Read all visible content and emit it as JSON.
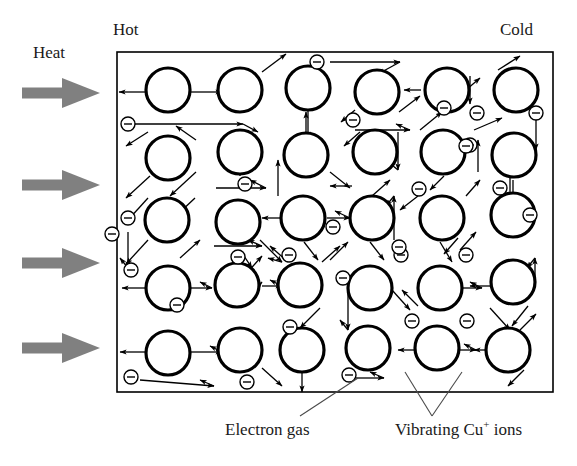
{
  "figure": {
    "type": "physics-diagram",
    "background_color": "#ffffff",
    "ink_color": "#000000",
    "heat_arrow_color": "#808080",
    "box": {
      "x": 117,
      "y": 52,
      "width": 436,
      "height": 340,
      "stroke_width": 1.6
    }
  },
  "labels": {
    "hot": "Hot",
    "cold": "Cold",
    "heat": "Heat",
    "electron_gas": "Electron gas",
    "cu_ions_prefix": "Vibrating Cu",
    "cu_ions_sup": "+",
    "cu_ions_suffix": " ions"
  },
  "heat_arrows": {
    "count": 4,
    "direction": "right",
    "color": "#808080",
    "items": [
      {
        "y": 93
      },
      {
        "y": 185
      },
      {
        "y": 263
      },
      {
        "y": 348
      }
    ],
    "shaft_x": 22,
    "shaft_width": 40,
    "shaft_height": 11,
    "head_width": 38,
    "head_height": 30
  },
  "ions": {
    "label": "Cu+ ion",
    "radius": 22,
    "stroke_width": 3.2,
    "fill": "#ffffff",
    "positions": [
      [
        168,
        90
      ],
      [
        240,
        90
      ],
      [
        308,
        88
      ],
      [
        377,
        92
      ],
      [
        447,
        90
      ],
      [
        516,
        90
      ],
      [
        168,
        158
      ],
      [
        240,
        152
      ],
      [
        306,
        155
      ],
      [
        375,
        152
      ],
      [
        443,
        152
      ],
      [
        514,
        155
      ],
      [
        167,
        220
      ],
      [
        238,
        222
      ],
      [
        303,
        218
      ],
      [
        372,
        218
      ],
      [
        442,
        218
      ],
      [
        513,
        215
      ],
      [
        168,
        288
      ],
      [
        237,
        285
      ],
      [
        300,
        285
      ],
      [
        370,
        288
      ],
      [
        440,
        288
      ],
      [
        513,
        282
      ],
      [
        168,
        353
      ],
      [
        240,
        350
      ],
      [
        302,
        350
      ],
      [
        368,
        348
      ],
      [
        437,
        348
      ],
      [
        508,
        350
      ]
    ]
  },
  "electrons": {
    "label": "electron",
    "symbol": "minus",
    "radius": 7,
    "stroke_width": 1.4,
    "positions": [
      [
        128,
        124
      ],
      [
        317,
        62
      ],
      [
        444,
        108
      ],
      [
        470,
        145
      ],
      [
        238,
        257
      ],
      [
        128,
        218
      ],
      [
        131,
        270
      ],
      [
        112,
        234
      ],
      [
        245,
        184
      ],
      [
        177,
        305
      ],
      [
        333,
        227
      ],
      [
        343,
        278
      ],
      [
        353,
        120
      ],
      [
        401,
        255
      ],
      [
        419,
        189
      ],
      [
        399,
        247
      ],
      [
        412,
        321
      ],
      [
        466,
        146
      ],
      [
        500,
        188
      ],
      [
        530,
        215
      ],
      [
        536,
        113
      ],
      [
        467,
        321
      ],
      [
        477,
        113
      ],
      [
        247,
        382
      ],
      [
        131,
        377
      ],
      [
        349,
        375
      ],
      [
        290,
        327
      ],
      [
        289,
        255
      ],
      [
        466,
        255
      ]
    ]
  },
  "motion_arrows": {
    "label": "velocity / vibration arrows",
    "stroke_width": 1.3,
    "head_size": 5
  },
  "leader_lines": {
    "electron_gas": {
      "from": [
        300,
        416
      ],
      "to": [
        358,
        378
      ]
    },
    "cu_ions_left": {
      "from": [
        432,
        416
      ],
      "to": [
        405,
        372
      ]
    },
    "cu_ions_right": {
      "from": [
        432,
        416
      ],
      "to": [
        462,
        372
      ]
    }
  }
}
